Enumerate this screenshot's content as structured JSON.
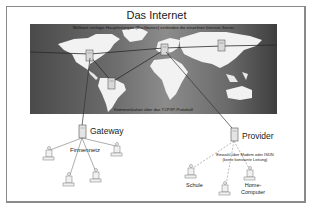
{
  "diagram": {
    "title": "Das Internet",
    "map": {
      "caption_top": "Weltweit verlegte Hauptleitungen (Backbones) verbinden die einzelnen Internet-Server",
      "caption_bottom": "Kommunikation über das TCP/IP-Protokoll",
      "servers": [
        "north-america",
        "south-america",
        "europe",
        "asia"
      ]
    },
    "gateway": {
      "label": "Gateway",
      "network_label": "Firmennetz",
      "clients": 5
    },
    "provider": {
      "label": "Provider",
      "connection_note_line1": "Einwahl über Modem oder ISDN",
      "connection_note_line2": "(keine konstante Leitung)",
      "clients": [
        {
          "label": "Schule"
        },
        {
          "label": ""
        },
        {
          "label_line1": "Home-",
          "label_line2": "Computer"
        }
      ]
    },
    "colors": {
      "frame": "#8a8a8a",
      "map_dark": "#4a4a4a",
      "map_light": "#8c8c8c",
      "land": "#f2f2f2",
      "lines": "#333333"
    }
  }
}
